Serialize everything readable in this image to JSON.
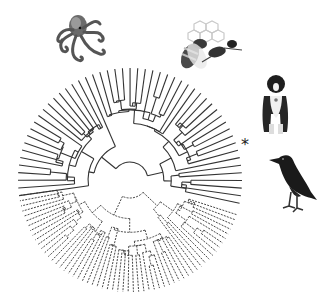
{
  "figure": {
    "type": "circular phylogenetic tree",
    "center": [
      130,
      180
    ],
    "tip_radius": 112,
    "line_color": "#333333",
    "clades": [
      {
        "name": "solid-clade",
        "style": "solid",
        "leaf_count": 52,
        "start_angle": 190,
        "end_angle": 345
      },
      {
        "name": "dashed-clade",
        "style": "dashed",
        "leaf_count": 58,
        "start_angle": 350,
        "end_angle": 520
      }
    ],
    "marker": {
      "symbol": "*",
      "position": [
        241,
        137
      ]
    }
  },
  "illustrations": [
    {
      "name": "octopus",
      "label": "Octopus",
      "position": [
        52,
        12
      ],
      "size": [
        62,
        55
      ]
    },
    {
      "name": "bee",
      "label": "Honeybee",
      "position": [
        172,
        18
      ],
      "size": [
        75,
        58
      ]
    },
    {
      "name": "dog",
      "label": "Dog",
      "position": [
        256,
        74
      ],
      "size": [
        38,
        64
      ]
    },
    {
      "name": "crow",
      "label": "Crow",
      "position": [
        267,
        152
      ],
      "size": [
        52,
        62
      ]
    }
  ]
}
